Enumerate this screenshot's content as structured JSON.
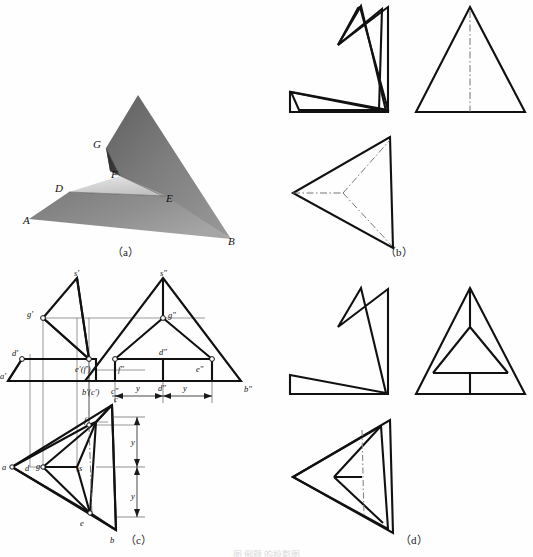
{
  "figure": {
    "captions": {
      "a": "（a）",
      "b": "（b）",
      "c": "（c）",
      "d": "（d）"
    },
    "bottom_caption": "图   例题   的投影图"
  },
  "panel_a": {
    "title": "pictorial-view",
    "description": "shaded 3D solid: folded triangular sheet",
    "labels": [
      {
        "id": "A",
        "text": "A",
        "x": 23,
        "y": 219
      },
      {
        "id": "B",
        "text": "B",
        "x": 228,
        "y": 240
      },
      {
        "id": "D",
        "text": "D",
        "x": 57,
        "y": 187
      },
      {
        "id": "E",
        "text": "E",
        "x": 166,
        "y": 196
      },
      {
        "id": "F",
        "text": "F",
        "x": 114,
        "y": 174
      },
      {
        "id": "G",
        "text": "G",
        "x": 97,
        "y": 143
      }
    ],
    "colors": {
      "face_dark": "#6b6b6b",
      "face_mid": "#8c8c8c",
      "face_light": "#d8d8d8",
      "face_shadow": "#3b3b3b"
    }
  },
  "panel_b": {
    "title": "three-view-wireframe-1",
    "views": [
      "front-view",
      "left-side-view",
      "top-view"
    ],
    "line_types": [
      "solid-outline",
      "dash-dot-centerline"
    ]
  },
  "panel_c": {
    "title": "projection-with-labels",
    "views": [
      "front-view",
      "side-view",
      "top-view"
    ],
    "front_labels": [
      {
        "id": "s-prime",
        "text": "s′",
        "x": 75,
        "y": 277
      },
      {
        "id": "g-prime",
        "text": "g′",
        "x": 22,
        "y": 318
      },
      {
        "id": "d-prime",
        "text": "d′",
        "x": 10,
        "y": 354
      },
      {
        "id": "a-prime",
        "text": "a′",
        "x": 2,
        "y": 377
      },
      {
        "id": "ef-prime",
        "text": "e′(f′)",
        "x": 79,
        "y": 372
      },
      {
        "id": "bc-prime",
        "text": "b′(c′)",
        "x": 85,
        "y": 394
      }
    ],
    "side_labels": [
      {
        "id": "s-dprime",
        "text": "s″",
        "x": 186,
        "y": 276
      },
      {
        "id": "g-dprime",
        "text": "g″",
        "x": 196,
        "y": 318
      },
      {
        "id": "d-dprime",
        "text": "d″",
        "x": 186,
        "y": 352
      },
      {
        "id": "f-dprime",
        "text": "f″",
        "x": 153,
        "y": 371
      },
      {
        "id": "e-dprime",
        "text": "e″",
        "x": 212,
        "y": 371
      },
      {
        "id": "c-dprime",
        "text": "c″",
        "x": 134,
        "y": 392
      },
      {
        "id": "b-dprime",
        "text": "b″",
        "x": 252,
        "y": 390
      }
    ],
    "top_labels": [
      {
        "id": "c",
        "text": "c",
        "x": 115,
        "y": 403
      },
      {
        "id": "f",
        "text": "f",
        "x": 88,
        "y": 424
      },
      {
        "id": "a",
        "text": "a",
        "x": 4,
        "y": 467
      },
      {
        "id": "d",
        "text": "d",
        "x": 39,
        "y": 468
      },
      {
        "id": "g",
        "text": "g",
        "x": 52,
        "y": 466
      },
      {
        "id": "s",
        "text": "s",
        "x": 86,
        "y": 469
      },
      {
        "id": "e",
        "text": "e",
        "x": 90,
        "y": 514
      },
      {
        "id": "b",
        "text": "b",
        "x": 113,
        "y": 530
      }
    ],
    "dimensions": [
      {
        "id": "y-side-left",
        "text": "y",
        "x": 166,
        "y": 390
      },
      {
        "id": "d-side-mid",
        "text": "d″",
        "x": 192,
        "y": 390
      },
      {
        "id": "y-side-right",
        "text": "y",
        "x": 213,
        "y": 390
      },
      {
        "id": "y-top-upper",
        "text": "y",
        "x": 129,
        "y": 440
      },
      {
        "id": "y-top-lower",
        "text": "y",
        "x": 129,
        "y": 497
      }
    ]
  },
  "panel_d": {
    "title": "three-view-wireframe-2",
    "views": [
      "front-view",
      "left-side-view",
      "top-view"
    ],
    "line_types": [
      "solid-outline",
      "dash-dot-centerline"
    ]
  }
}
